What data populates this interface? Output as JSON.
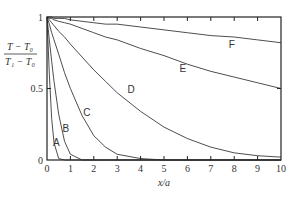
{
  "chart_data": {
    "type": "line",
    "title": "",
    "xlabel": "x/a",
    "ylabel": {
      "numerator": "T − T₀",
      "denominator": "T₁ − T₀"
    },
    "xlim": [
      0,
      10
    ],
    "ylim": [
      0,
      1
    ],
    "grid": false,
    "legend": "inline curve labels",
    "x_ticks": [
      "0",
      "1",
      "2",
      "3",
      "4",
      "5",
      "6",
      "7",
      "8",
      "9",
      "10"
    ],
    "y_ticks": [
      "0",
      "0.5",
      "1"
    ],
    "x": [
      0,
      0.1,
      0.2,
      0.3,
      0.5,
      0.75,
      1,
      1.5,
      2,
      2.5,
      3,
      4,
      5,
      6,
      7,
      8,
      9,
      10
    ],
    "series": [
      {
        "name": "A",
        "values": [
          1,
          0.6,
          0.29,
          0.12,
          0.01,
          0,
          0,
          0,
          0,
          0,
          0,
          0,
          0,
          0,
          0,
          0,
          0,
          0
        ]
      },
      {
        "name": "B",
        "values": [
          1,
          0.84,
          0.69,
          0.55,
          0.32,
          0.13,
          0.04,
          0,
          0,
          0,
          0,
          0,
          0,
          0,
          0,
          0,
          0,
          0
        ]
      },
      {
        "name": "C",
        "values": [
          1,
          0.95,
          0.89,
          0.84,
          0.74,
          0.61,
          0.5,
          0.31,
          0.17,
          0.09,
          0.04,
          0.01,
          0,
          0,
          0,
          0,
          0,
          0
        ]
      },
      {
        "name": "D",
        "values": [
          1,
          0.98,
          0.96,
          0.94,
          0.9,
          0.86,
          0.81,
          0.72,
          0.63,
          0.55,
          0.47,
          0.34,
          0.23,
          0.15,
          0.09,
          0.05,
          0.03,
          0.02
        ]
      },
      {
        "name": "E",
        "values": [
          1,
          0.99,
          0.99,
          0.98,
          0.97,
          0.96,
          0.95,
          0.92,
          0.89,
          0.86,
          0.84,
          0.78,
          0.73,
          0.67,
          0.62,
          0.58,
          0.54,
          0.5
        ]
      },
      {
        "name": "F",
        "values": [
          1,
          1.0,
          1.0,
          0.99,
          0.99,
          0.99,
          0.98,
          0.97,
          0.96,
          0.95,
          0.95,
          0.93,
          0.91,
          0.89,
          0.87,
          0.86,
          0.84,
          0.82
        ]
      }
    ],
    "curve_label_positions": {
      "A": [
        0.4,
        0.12
      ],
      "B": [
        0.8,
        0.22
      ],
      "C": [
        1.7,
        0.33
      ],
      "D": [
        3.6,
        0.49
      ],
      "E": [
        5.8,
        0.64
      ],
      "F": [
        7.9,
        0.81
      ]
    }
  }
}
